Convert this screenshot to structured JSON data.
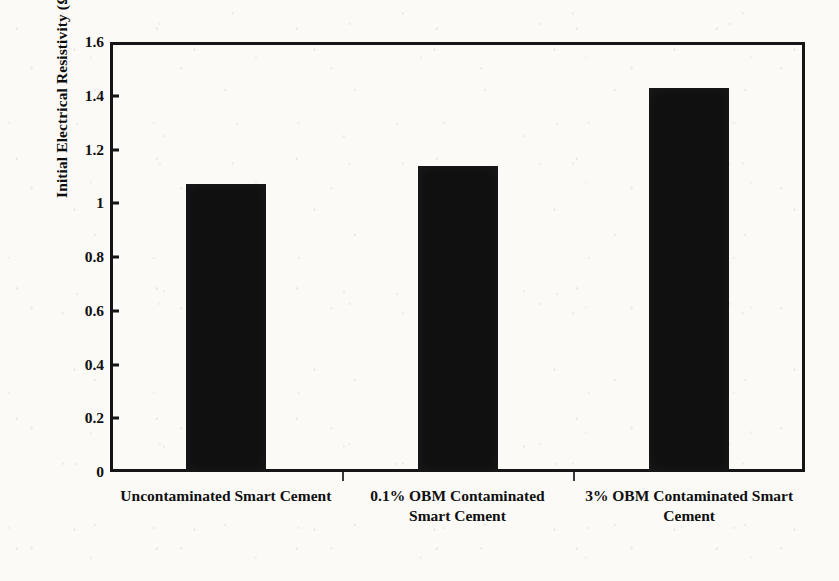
{
  "chart_data": {
    "type": "bar",
    "title": "",
    "xlabel": "",
    "ylabel": "Initial Electrical Resistivity (Ω.m)",
    "categories": [
      "Uncontaminated Smart Cement",
      "0.1% OBM Contaminated Smart Cement",
      "3% OBM Contaminated Smart Cement"
    ],
    "values": [
      1.07,
      1.14,
      1.43
    ],
    "ylim": [
      0,
      1.6
    ],
    "ytick_labels": [
      "0",
      "0.2",
      "0.4",
      "0.6",
      "0.8",
      "1",
      "1.2",
      "1.4",
      "1.6"
    ],
    "ytick_values": [
      0,
      0.2,
      0.4,
      0.6,
      0.8,
      1,
      1.2,
      1.4,
      1.6
    ],
    "grid": false,
    "legend": false,
    "bar_color": "#111010",
    "axis_color": "#151515",
    "background_color": "#fbfaf7"
  },
  "axis": {
    "y_title": "Initial Electrical Resistivity (Ω.m)"
  }
}
